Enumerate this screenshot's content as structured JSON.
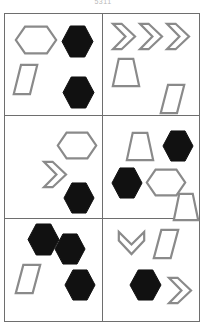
{
  "header": {
    "title_fragment": "5311"
  },
  "figure": {
    "name": "six-panel-shape-grid",
    "grid": {
      "columns": 2,
      "rows": 3,
      "border_color": "#6e6e6e",
      "background_color": "#ffffff"
    },
    "palette": {
      "outline_stroke": "#8a8a8a",
      "outline_fill": "#ffffff",
      "solid_fill": "#111111"
    },
    "shape_legend": [
      {
        "key": "hexagon-wide-outline",
        "label": "wide hexagon outline"
      },
      {
        "key": "hexagon-solid",
        "label": "solid black hexagon"
      },
      {
        "key": "parallelogram-outline",
        "label": "parallelogram outline"
      },
      {
        "key": "trapezoid-outline",
        "label": "trapezoid outline"
      },
      {
        "key": "chevron-right-outline",
        "label": "right-pointing chevron outline"
      },
      {
        "key": "chevron-down-outline",
        "label": "down-pointing chevron outline"
      }
    ],
    "panels": [
      {
        "id": "panel-1",
        "position": "top-left",
        "row": 1,
        "column": 1,
        "shape_count": 4,
        "shapes": [
          {
            "type": "hexagon-wide-outline",
            "fill": "outline",
            "x": 10,
            "y": 12,
            "w": 42,
            "h": 28,
            "rotation": 0
          },
          {
            "type": "hexagon-solid",
            "fill": "solid",
            "x": 56,
            "y": 11,
            "w": 33,
            "h": 33,
            "rotation": 0
          },
          {
            "type": "parallelogram-outline",
            "fill": "outline",
            "x": 8,
            "y": 50,
            "w": 25,
            "h": 31,
            "rotation": 0
          },
          {
            "type": "hexagon-solid",
            "fill": "solid",
            "x": 57,
            "y": 62,
            "w": 33,
            "h": 33,
            "rotation": 0
          }
        ]
      },
      {
        "id": "panel-2",
        "position": "top-right",
        "row": 1,
        "column": 2,
        "shape_count": 5,
        "shapes": [
          {
            "type": "chevron-right-outline",
            "fill": "outline",
            "x": 9,
            "y": 9,
            "w": 24,
            "h": 27,
            "rotation": 0
          },
          {
            "type": "chevron-right-outline",
            "fill": "outline",
            "x": 36,
            "y": 9,
            "w": 24,
            "h": 27,
            "rotation": 0
          },
          {
            "type": "chevron-right-outline",
            "fill": "outline",
            "x": 63,
            "y": 9,
            "w": 24,
            "h": 27,
            "rotation": 0
          },
          {
            "type": "trapezoid-outline",
            "fill": "outline",
            "x": 9,
            "y": 44,
            "w": 28,
            "h": 29,
            "rotation": 0
          },
          {
            "type": "parallelogram-outline",
            "fill": "outline",
            "x": 57,
            "y": 70,
            "w": 25,
            "h": 30,
            "rotation": 0
          }
        ]
      },
      {
        "id": "panel-3",
        "position": "middle-left",
        "row": 2,
        "column": 1,
        "shape_count": 3,
        "shapes": [
          {
            "type": "hexagon-wide-outline",
            "fill": "outline",
            "x": 52,
            "y": 16,
            "w": 40,
            "h": 27,
            "rotation": 0
          },
          {
            "type": "chevron-right-outline",
            "fill": "outline",
            "x": 38,
            "y": 45,
            "w": 24,
            "h": 27,
            "rotation": 0
          },
          {
            "type": "hexagon-solid",
            "fill": "solid",
            "x": 58,
            "y": 66,
            "w": 32,
            "h": 32,
            "rotation": 0
          }
        ]
      },
      {
        "id": "panel-4",
        "position": "middle-right",
        "row": 2,
        "column": 2,
        "shape_count": 5,
        "shapes": [
          {
            "type": "trapezoid-outline",
            "fill": "outline",
            "x": 23,
            "y": 16,
            "w": 28,
            "h": 29,
            "rotation": 0
          },
          {
            "type": "hexagon-solid",
            "fill": "solid",
            "x": 59,
            "y": 14,
            "w": 32,
            "h": 32,
            "rotation": 0
          },
          {
            "type": "hexagon-solid",
            "fill": "solid",
            "x": 8,
            "y": 51,
            "w": 32,
            "h": 32,
            "rotation": 0
          },
          {
            "type": "hexagon-wide-outline",
            "fill": "outline",
            "x": 43,
            "y": 53,
            "w": 40,
            "h": 27,
            "rotation": 0
          },
          {
            "type": "trapezoid-outline",
            "fill": "outline",
            "x": 70,
            "y": 77,
            "w": 26,
            "h": 28,
            "rotation": 0
          }
        ]
      },
      {
        "id": "panel-5",
        "position": "bottom-left",
        "row": 3,
        "column": 1,
        "shape_count": 4,
        "shapes": [
          {
            "type": "hexagon-solid",
            "fill": "solid",
            "x": 22,
            "y": 4,
            "w": 33,
            "h": 33,
            "rotation": 0
          },
          {
            "type": "hexagon-solid",
            "fill": "solid",
            "x": 49,
            "y": 14,
            "w": 32,
            "h": 32,
            "rotation": 0
          },
          {
            "type": "parallelogram-outline",
            "fill": "outline",
            "x": 10,
            "y": 45,
            "w": 26,
            "h": 30,
            "rotation": 0
          },
          {
            "type": "hexagon-solid",
            "fill": "solid",
            "x": 59,
            "y": 50,
            "w": 32,
            "h": 32,
            "rotation": 0
          }
        ]
      },
      {
        "id": "panel-6",
        "position": "bottom-right",
        "row": 3,
        "column": 2,
        "shape_count": 4,
        "shapes": [
          {
            "type": "chevron-down-outline",
            "fill": "outline",
            "x": 15,
            "y": 12,
            "w": 27,
            "h": 24,
            "rotation": 0
          },
          {
            "type": "parallelogram-outline",
            "fill": "outline",
            "x": 50,
            "y": 10,
            "w": 26,
            "h": 30,
            "rotation": 0
          },
          {
            "type": "hexagon-solid",
            "fill": "solid",
            "x": 26,
            "y": 50,
            "w": 33,
            "h": 32,
            "rotation": 0
          },
          {
            "type": "chevron-right-outline",
            "fill": "outline",
            "x": 65,
            "y": 58,
            "w": 24,
            "h": 27,
            "rotation": 0
          }
        ]
      }
    ]
  }
}
